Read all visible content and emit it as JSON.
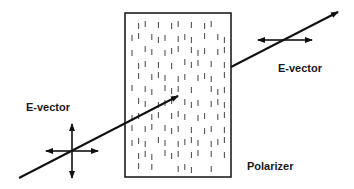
{
  "diagram": {
    "type": "polarizer-schematic",
    "labels": {
      "incident_evector": "E-vector",
      "transmitted_evector": "E-vector",
      "polarizer": "Polarizer"
    },
    "colors": {
      "line": "#111111",
      "dash": "#555555",
      "background": "#ffffff"
    },
    "polarizer_box": {
      "x": 125,
      "y": 13,
      "width": 106,
      "height": 164
    },
    "incident_ray": {
      "from": [
        19,
        178
      ],
      "to": [
        178,
        96
      ]
    },
    "transmitted_ray": {
      "from": [
        231,
        67
      ],
      "to": [
        338,
        12
      ]
    },
    "incident_cross": {
      "cx": 72,
      "cy": 151,
      "h_half": 26,
      "v_half": 27
    },
    "transmitted_cross": {
      "cx": 285,
      "cy": 40,
      "h_half": 27
    },
    "dash_grid": {
      "x0": 132,
      "dx": 6.6,
      "cols": 15,
      "y0": 22,
      "dy": 13,
      "rows": 12,
      "length": 6,
      "pattern": [
        "011010110101100",
        "110111011101011",
        "101101110111011",
        "011010101110101",
        "010111011011101",
        "101101110100111",
        "011011101110111",
        "110110111011011",
        "101101110101101",
        "111011011110111",
        "011101110110101",
        "010100011100100"
      ]
    }
  }
}
